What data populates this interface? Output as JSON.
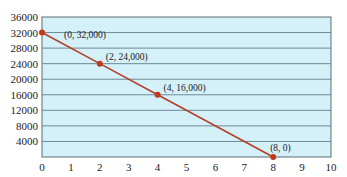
{
  "chart_data": {
    "type": "line",
    "title": "",
    "xlabel": "",
    "ylabel": "",
    "x": [
      0,
      2,
      4,
      8
    ],
    "series": [
      {
        "name": "line",
        "values": [
          32000,
          24000,
          16000,
          0
        ],
        "color": "#b5402a"
      }
    ],
    "points": [
      {
        "x": 0,
        "y": 32000,
        "label": "(0, 32,000)"
      },
      {
        "x": 2,
        "y": 24000,
        "label": "(2, 24,000)"
      },
      {
        "x": 4,
        "y": 16000,
        "label": "(4, 16,000)"
      },
      {
        "x": 8,
        "y": 0,
        "label": "(8, 0)"
      }
    ],
    "xlim": [
      0,
      10
    ],
    "ylim": [
      0,
      36000
    ],
    "xticks": [
      "0",
      "1",
      "2",
      "3",
      "4",
      "5",
      "6",
      "7",
      "8",
      "9",
      "10"
    ],
    "yticks": [
      "4000",
      "8000",
      "12000",
      "16000",
      "20000",
      "24000",
      "28000",
      "32000",
      "36000"
    ],
    "grid": "horizontal",
    "legend": "none",
    "colors": {
      "plot_background": "#d4f0f9",
      "grid": "#6f8a95",
      "line": "#b5402a",
      "marker": "#c0391b"
    }
  }
}
